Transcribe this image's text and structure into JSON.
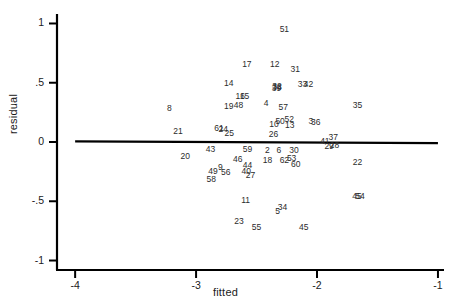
{
  "chart_data": {
    "type": "scatter",
    "title": "",
    "subtitle": "",
    "xlabel": "fitted",
    "ylabel": "residual",
    "xlim": [
      -4.15,
      -0.95
    ],
    "ylim": [
      -1.08,
      1.08
    ],
    "xticks": [
      -4,
      -3,
      -2,
      -1
    ],
    "xticklabels": [
      "-4",
      "-3",
      "-2",
      "-1"
    ],
    "yticks": [
      1,
      0.5,
      0,
      -0.5,
      -1
    ],
    "yticklabels": [
      "1",
      ".5",
      "0",
      "-.5",
      "-1"
    ],
    "grid": false,
    "legend": null,
    "marker_style": "observation-number-label",
    "reference_line": {
      "name": "zero-residual-line",
      "type": "line",
      "x": [
        -4.0,
        -1.0
      ],
      "y": [
        0.005,
        -0.01
      ],
      "color": "#000000",
      "width": 2.2
    },
    "points": [
      {
        "label": "51",
        "x": -2.27,
        "y": 0.95
      },
      {
        "label": "17",
        "x": -2.58,
        "y": 0.66
      },
      {
        "label": "12",
        "x": -2.35,
        "y": 0.655
      },
      {
        "label": "31",
        "x": -2.18,
        "y": 0.62
      },
      {
        "label": "14",
        "x": -2.73,
        "y": 0.5
      },
      {
        "label": "32",
        "x": -2.33,
        "y": 0.475
      },
      {
        "label": "38",
        "x": -2.33,
        "y": 0.468
      },
      {
        "label": "39",
        "x": -2.335,
        "y": 0.455
      },
      {
        "label": "33",
        "x": -2.12,
        "y": 0.49
      },
      {
        "label": "42",
        "x": -2.07,
        "y": 0.49
      },
      {
        "label": "16",
        "x": -2.635,
        "y": 0.385
      },
      {
        "label": "15",
        "x": -2.6,
        "y": 0.385
      },
      {
        "label": "4",
        "x": -2.42,
        "y": 0.325
      },
      {
        "label": "35",
        "x": -1.665,
        "y": 0.315
      },
      {
        "label": "19",
        "x": -2.73,
        "y": 0.3
      },
      {
        "label": "48",
        "x": -2.65,
        "y": 0.315
      },
      {
        "label": "57",
        "x": -2.28,
        "y": 0.295
      },
      {
        "label": "8",
        "x": -3.22,
        "y": 0.285
      },
      {
        "label": "52",
        "x": -2.23,
        "y": 0.195
      },
      {
        "label": "50",
        "x": -2.305,
        "y": 0.18
      },
      {
        "label": "3",
        "x": -2.05,
        "y": 0.18
      },
      {
        "label": "36",
        "x": -2.01,
        "y": 0.165
      },
      {
        "label": "10",
        "x": -2.355,
        "y": 0.155
      },
      {
        "label": "13",
        "x": -2.225,
        "y": 0.145
      },
      {
        "label": "61",
        "x": -2.81,
        "y": 0.115
      },
      {
        "label": "24",
        "x": -2.775,
        "y": 0.11
      },
      {
        "label": "21",
        "x": -3.15,
        "y": 0.095
      },
      {
        "label": "25",
        "x": -2.725,
        "y": 0.075
      },
      {
        "label": "26",
        "x": -2.36,
        "y": 0.065
      },
      {
        "label": "37",
        "x": -1.865,
        "y": 0.04
      },
      {
        "label": "41",
        "x": -1.935,
        "y": 0.005
      },
      {
        "label": "29",
        "x": -1.9,
        "y": -0.03
      },
      {
        "label": "28",
        "x": -1.855,
        "y": -0.025
      },
      {
        "label": "43",
        "x": -2.88,
        "y": -0.055
      },
      {
        "label": "59",
        "x": -2.575,
        "y": -0.055
      },
      {
        "label": "2",
        "x": -2.41,
        "y": -0.065
      },
      {
        "label": "6",
        "x": -2.315,
        "y": -0.065
      },
      {
        "label": "30",
        "x": -2.19,
        "y": -0.065
      },
      {
        "label": "20",
        "x": -3.09,
        "y": -0.12
      },
      {
        "label": "53",
        "x": -2.21,
        "y": -0.135
      },
      {
        "label": "18",
        "x": -2.41,
        "y": -0.155
      },
      {
        "label": "62",
        "x": -2.27,
        "y": -0.155
      },
      {
        "label": "46",
        "x": -2.655,
        "y": -0.145
      },
      {
        "label": "22",
        "x": -1.665,
        "y": -0.165
      },
      {
        "label": "60",
        "x": -2.175,
        "y": -0.185
      },
      {
        "label": "44",
        "x": -2.575,
        "y": -0.195
      },
      {
        "label": "9",
        "x": -2.8,
        "y": -0.21
      },
      {
        "label": "49",
        "x": -2.86,
        "y": -0.245
      },
      {
        "label": "56",
        "x": -2.755,
        "y": -0.25
      },
      {
        "label": "40",
        "x": -2.585,
        "y": -0.245
      },
      {
        "label": "27",
        "x": -2.55,
        "y": -0.275
      },
      {
        "label": "58",
        "x": -2.875,
        "y": -0.315
      },
      {
        "label": "45",
        "x": -1.67,
        "y": -0.455
      },
      {
        "label": "54",
        "x": -1.645,
        "y": -0.455
      },
      {
        "label": "11",
        "x": -2.59,
        "y": -0.49
      },
      {
        "label": "34",
        "x": -2.285,
        "y": -0.545
      },
      {
        "label": "5",
        "x": -2.325,
        "y": -0.58
      },
      {
        "label": "23",
        "x": -2.645,
        "y": -0.665
      },
      {
        "label": "55",
        "x": -2.5,
        "y": -0.715
      },
      {
        "label": "45b",
        "x": -2.11,
        "y": -0.715
      }
    ],
    "point_count": 61,
    "axes_color": "#000000"
  }
}
